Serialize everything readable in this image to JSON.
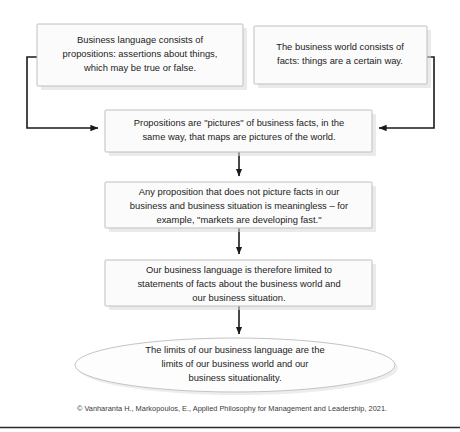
{
  "diagram": {
    "type": "flowchart",
    "colors": {
      "node_fill": "#fbfbfb",
      "node_border": "#bfbfbf",
      "connector": "#1a1a1a",
      "text": "#1c1c1c",
      "caption": "#3a3a3a",
      "background": "#ffffff"
    },
    "nodes": [
      {
        "id": "business-language",
        "shape": "rectangle",
        "lines": [
          "Business language consists of",
          "propositions: assertions about things,",
          "which may be true or false."
        ]
      },
      {
        "id": "business-world",
        "shape": "rectangle",
        "lines": [
          "The business world consists of",
          "facts: things are a certain way."
        ]
      },
      {
        "id": "propositions-pictures",
        "shape": "rectangle",
        "lines": [
          "Propositions are \"pictures\" of business facts, in the",
          "same way, that maps are pictures of the world."
        ]
      },
      {
        "id": "meaningless-proposition",
        "shape": "rectangle",
        "lines": [
          "Any proposition that does not picture facts in our",
          "business and business situation is meaningless – for",
          "example, \"markets are developing fast.\""
        ]
      },
      {
        "id": "language-limited",
        "shape": "rectangle",
        "lines": [
          "Our business language is therefore limited to",
          "statements of facts about the business world and",
          "our business situation."
        ]
      },
      {
        "id": "limits-conclusion",
        "shape": "ellipse",
        "lines": [
          "The limits of our business language are the",
          "limits of our business world and our",
          "business situationality."
        ]
      }
    ],
    "connectors": [
      {
        "id": "business-language-to-propositions",
        "from": "business-language",
        "to": "propositions-pictures",
        "style": "elbow-left",
        "arrow": "right"
      },
      {
        "id": "business-world-to-propositions",
        "from": "business-world",
        "to": "propositions-pictures",
        "style": "elbow-right",
        "arrow": "left"
      },
      {
        "id": "propositions-to-meaningless",
        "from": "propositions-pictures",
        "to": "meaningless-proposition",
        "style": "straight",
        "arrow": "down"
      },
      {
        "id": "meaningless-to-limited",
        "from": "meaningless-proposition",
        "to": "language-limited",
        "style": "straight",
        "arrow": "down"
      },
      {
        "id": "limited-to-conclusion",
        "from": "language-limited",
        "to": "limits-conclusion",
        "style": "straight",
        "arrow": "down"
      }
    ]
  },
  "caption": {
    "text": "© Vanharanta H., Markopoulos, E., Applied Philosophy for Management and Leadership, 2021."
  }
}
